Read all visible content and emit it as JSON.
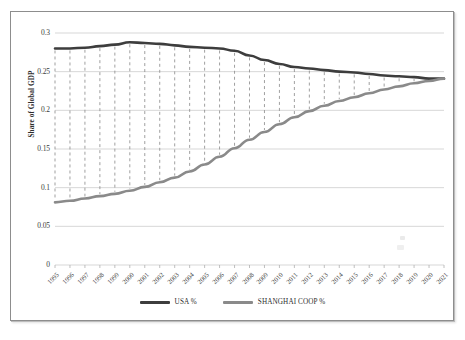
{
  "chart_data": {
    "type": "line",
    "title": "",
    "subtitle": "",
    "xlabel": "",
    "ylabel": "Share of Global GDP",
    "grid": true,
    "legend_position": "bottom",
    "ylim": [
      0,
      0.3
    ],
    "yticks": [
      "0",
      "0.05",
      "0.1",
      "0.15",
      "0.2",
      "0.25",
      "0.3"
    ],
    "ytick_values": [
      0,
      0.05,
      0.1,
      0.15,
      0.2,
      0.25,
      0.3
    ],
    "categories": [
      "1995",
      "1996",
      "1997",
      "1998",
      "1999",
      "2000",
      "2001",
      "2002",
      "2003",
      "2004",
      "2005",
      "2006",
      "2007",
      "2008",
      "2009",
      "2010",
      "2011",
      "2012",
      "2013",
      "2014",
      "2015",
      "2016",
      "2017",
      "2018",
      "2019",
      "2020",
      "2021"
    ],
    "series": [
      {
        "name": "USA %",
        "color": "#3d3d3d",
        "values": [
          0.28,
          0.28,
          0.281,
          0.283,
          0.285,
          0.288,
          0.287,
          0.286,
          0.284,
          0.282,
          0.281,
          0.28,
          0.277,
          0.271,
          0.265,
          0.26,
          0.256,
          0.254,
          0.252,
          0.25,
          0.249,
          0.247,
          0.245,
          0.244,
          0.243,
          0.241,
          0.241
        ]
      },
      {
        "name": "SHANGHAI COOP %",
        "color": "#8a8a8a",
        "values": [
          0.081,
          0.083,
          0.086,
          0.089,
          0.092,
          0.096,
          0.101,
          0.107,
          0.113,
          0.121,
          0.13,
          0.14,
          0.151,
          0.162,
          0.172,
          0.182,
          0.191,
          0.199,
          0.206,
          0.212,
          0.217,
          0.222,
          0.227,
          0.231,
          0.235,
          0.238,
          0.241
        ]
      }
    ],
    "dropline_style": "dashed",
    "dropline_color": "#8f8f8f"
  },
  "legend": {
    "entries": [
      {
        "label": "USA %",
        "color": "#3d3d3d"
      },
      {
        "label": "SHANGHAI COOP %",
        "color": "#8a8a8a"
      }
    ]
  }
}
